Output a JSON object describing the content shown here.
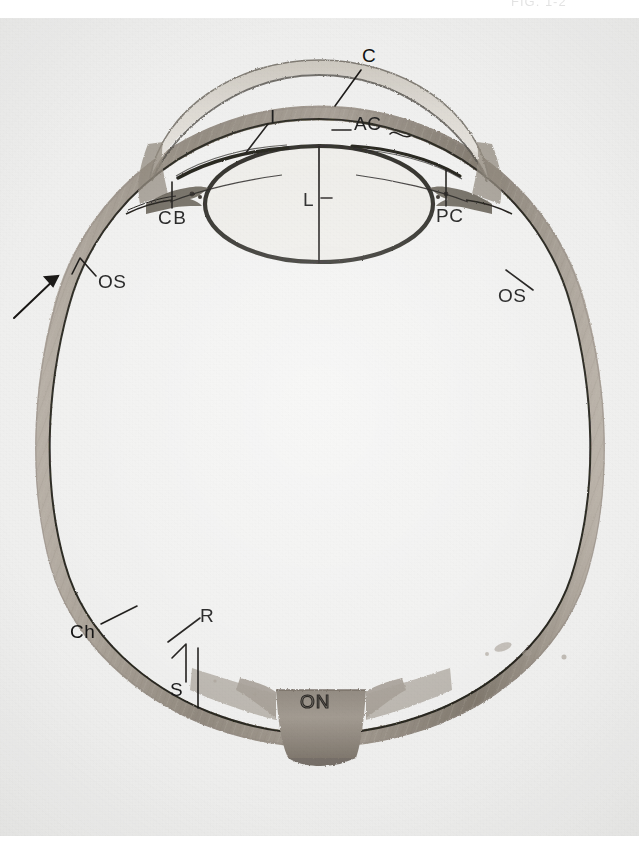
{
  "page": {
    "kind": "histology-photomicrograph",
    "top_caption_sliver": "FIG. 1-2",
    "background_color": "#ffffff",
    "photo_background_color": "#eeeeed",
    "ink_color": "#111111",
    "tissue_color": "#9a9289",
    "tissue_dark_color": "#6d6459"
  },
  "figure": {
    "type": "anatomical cross-section photomicrograph",
    "structures": [
      {
        "key": "C",
        "name": "cornea"
      },
      {
        "key": "AC",
        "name": "anterior chamber"
      },
      {
        "key": "I",
        "name": "iris"
      },
      {
        "key": "PC",
        "name": "posterior chamber"
      },
      {
        "key": "CB",
        "name": "ciliary body"
      },
      {
        "key": "L",
        "name": "lens"
      },
      {
        "key": "OS",
        "name": "ora serrata"
      },
      {
        "key": "Ch",
        "name": "choroid"
      },
      {
        "key": "R",
        "name": "retina"
      },
      {
        "key": "S",
        "name": "sclera"
      },
      {
        "key": "ON",
        "name": "optic nerve"
      }
    ]
  },
  "labels": {
    "cornea": {
      "text": "C",
      "x": 370,
      "y": 36
    },
    "iris": {
      "text": "I",
      "x": 272,
      "y": 97
    },
    "anterior_chamber": {
      "text": "AC",
      "x": 354,
      "y": 104
    },
    "ciliary_body": {
      "text": "CB",
      "x": 160,
      "y": 197
    },
    "lens": {
      "text": "L",
      "x": 308,
      "y": 173
    },
    "posterior_chamber": {
      "text": "PC",
      "x": 438,
      "y": 194
    },
    "ora_serrata_left": {
      "text": "OS",
      "x": 100,
      "y": 260
    },
    "ora_serrata_right": {
      "text": "OS",
      "x": 535,
      "y": 274
    },
    "choroid": {
      "text": "Ch",
      "x": 74,
      "y": 611
    },
    "retina": {
      "text": "R",
      "x": 203,
      "y": 594
    },
    "sclera": {
      "text": "S",
      "x": 173,
      "y": 668
    },
    "optic_nerve": {
      "text": "ON",
      "x": 304,
      "y": 679
    }
  }
}
